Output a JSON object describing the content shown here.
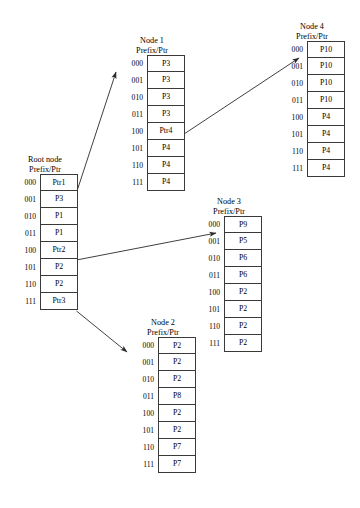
{
  "diagram": {
    "prefixes": [
      "000",
      "001",
      "010",
      "011",
      "100",
      "101",
      "110",
      "111"
    ],
    "header_line_2": "Prefix/Ptr",
    "nodes": [
      {
        "id": "root",
        "title": "Root node",
        "header": "Prefix/Ptr",
        "entries": [
          "Ptr1",
          "P3",
          "P1",
          "P1",
          "Ptr2",
          "P2",
          "P2",
          "Ptr3"
        ]
      },
      {
        "id": "node1",
        "title": "Node 1",
        "header": "Prefix/Ptr",
        "entries": [
          "P3",
          "P3",
          "P3",
          "P3",
          "Ptr4",
          "P4",
          "P4",
          "P4"
        ]
      },
      {
        "id": "node2",
        "title": "Node 2",
        "header": "Prefix/Ptr",
        "entries": [
          "P2",
          "P2",
          "P2",
          "P8",
          "P2",
          "P2",
          "P7",
          "P7"
        ]
      },
      {
        "id": "node3",
        "title": "Node 3",
        "header": "Prefix/Ptr",
        "entries": [
          "P9",
          "P5",
          "P6",
          "P6",
          "P2",
          "P2",
          "P2",
          "P2"
        ]
      },
      {
        "id": "node4",
        "title": "Node 4",
        "header": "Prefix/Ptr",
        "entries": [
          "P10",
          "P10",
          "P10",
          "P10",
          "P4",
          "P4",
          "P4",
          "P4"
        ]
      }
    ],
    "links": [
      {
        "id": "root-ptr1-to-node1",
        "from": "Ptr1",
        "to": "Node 1"
      },
      {
        "id": "root-ptr2-to-node3",
        "from": "Ptr2",
        "to": "Node 3"
      },
      {
        "id": "root-ptr3-to-node2",
        "from": "Ptr3",
        "to": "Node 2"
      },
      {
        "id": "node1-ptr4-to-node4",
        "from": "Ptr4",
        "to": "Node 4"
      }
    ],
    "colors": {
      "stroke": "#3a3a3a",
      "arrow": "#2a2a2a",
      "text": "#000000",
      "background": "#ffffff"
    }
  }
}
